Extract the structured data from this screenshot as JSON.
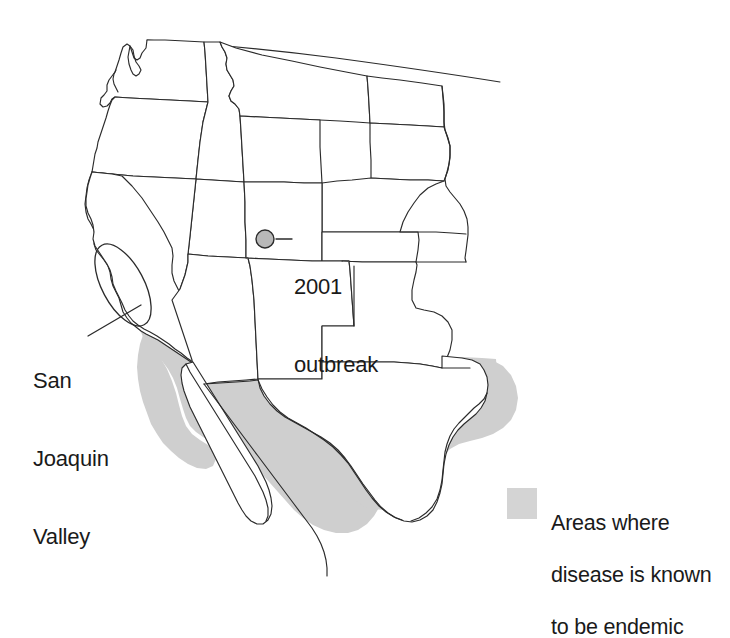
{
  "figure": {
    "kind": "thematic-map",
    "region": "Western United States and northern Mexico",
    "background_color": "#ffffff",
    "outline_color": "#2b2b2b"
  },
  "annotations": {
    "san_joaquin": {
      "label": "San\nJoaquin\nValley",
      "line1": "San",
      "line2": "Joaquin",
      "line3": "Valley"
    },
    "outbreak": {
      "label": "2001\noutbreak",
      "line1": "2001",
      "line2": "outbreak",
      "marker_color": "#b8b8b8"
    }
  },
  "legend": {
    "swatch_color": "#d4d4d4",
    "text": "Areas where\ndisease is known\nto be endemic",
    "line1": "Areas where",
    "line2": "disease is known",
    "line3": "to be endemic"
  }
}
